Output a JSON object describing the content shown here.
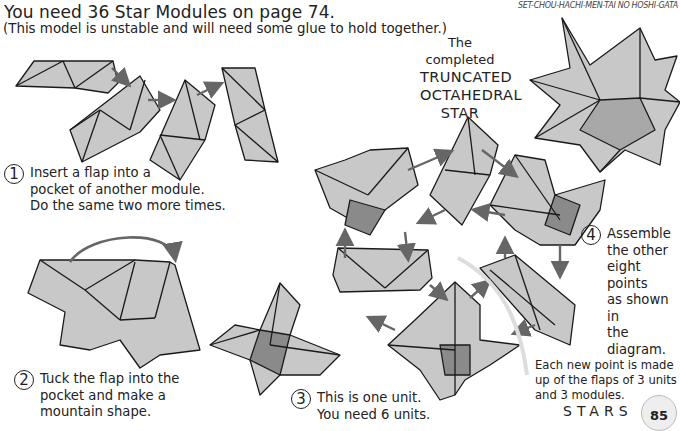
{
  "header": {
    "title": "You need 36 Star Modules on page 74.",
    "subtitle": "(This model is unstable and will need some glue to hold together.)",
    "japanese_name": "SET-CHOU-HACHI-MEN-TAI  NO HOSHI-GATA"
  },
  "completed": {
    "caption": "The completed",
    "name_lines": [
      "TRUNCATED",
      "OCTAHEDRAL",
      "STAR"
    ]
  },
  "steps": [
    {
      "number": "1",
      "lines": [
        "Insert a flap into a",
        "pocket of another  module.",
        "Do the same two more times."
      ]
    },
    {
      "number": "2",
      "lines": [
        "Tuck the flap into the",
        "pocket and make a",
        "mountain shape."
      ]
    },
    {
      "number": "3",
      "lines": [
        "This is one unit.",
        "You need 6 units."
      ]
    },
    {
      "number": "4",
      "lines": [
        "Assemble",
        "the other",
        "eight points",
        "as shown in",
        "the diagram."
      ]
    }
  ],
  "note": {
    "lines": [
      "Each new point is made",
      "up of the flaps of 3 units",
      "and 3 modules."
    ]
  },
  "footer": {
    "section": "STARS",
    "page_number": "85"
  },
  "colors": {
    "paper": "#c8c8c8",
    "paper_dark": "#8a8a8a",
    "arrow": "#666666",
    "line": "#1a1a1a"
  }
}
